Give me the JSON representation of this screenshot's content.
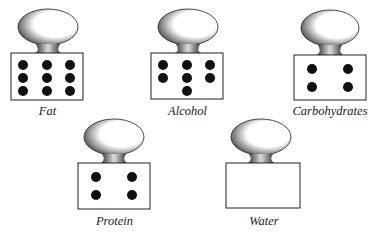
{
  "items": [
    {
      "name": "Fat",
      "dots": 9,
      "layout": "3x3"
    },
    {
      "name": "Alcohol",
      "dots": 7,
      "layout": "3-3-1"
    },
    {
      "name": "Carbohydrates",
      "dots": 4,
      "layout": "2x2"
    },
    {
      "name": "Protein",
      "dots": 4,
      "layout": "2x2"
    },
    {
      "name": "Water",
      "dots": 0,
      "layout": "empty"
    }
  ],
  "colors": {
    "ink": "#111111",
    "paper": "#ffffff"
  }
}
